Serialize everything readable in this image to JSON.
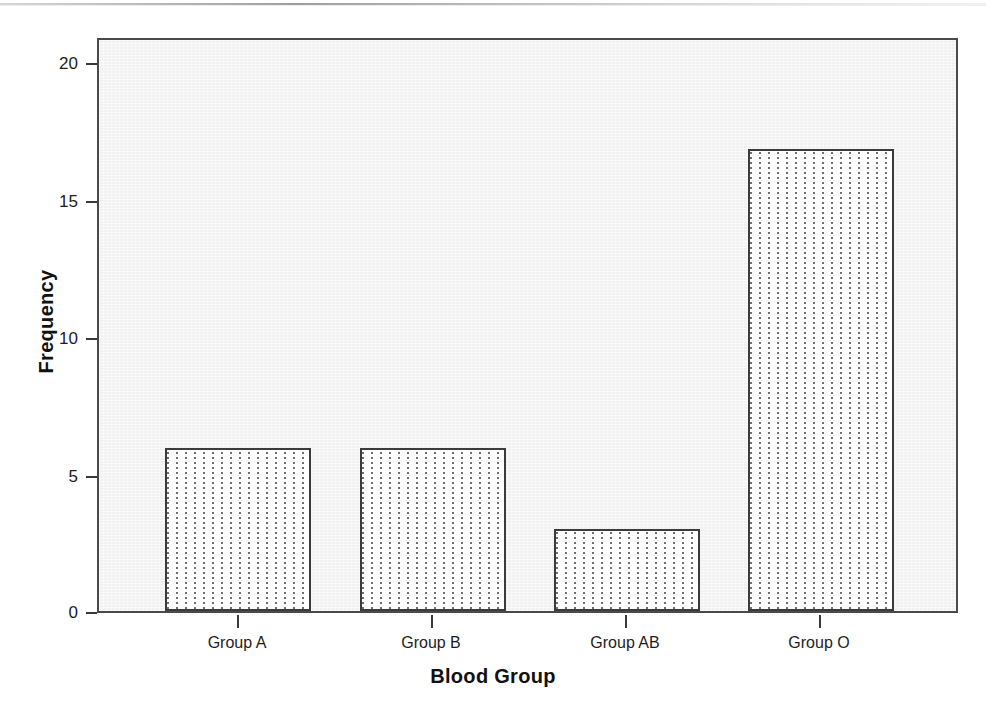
{
  "chart_data": {
    "type": "bar",
    "title": "",
    "xlabel": "Blood Group",
    "ylabel": "Frequency",
    "categories": [
      "Group A",
      "Group B",
      "Group AB",
      "Group O"
    ],
    "values": [
      6,
      6,
      3,
      17
    ],
    "ylim": [
      0,
      21
    ],
    "yticks": [
      0,
      5,
      10,
      15,
      20
    ],
    "ytick_labels": [
      "0",
      "5",
      "10",
      "15",
      "20"
    ],
    "grid": false,
    "legend": null,
    "legend_position": "none",
    "bar_fill": "white-with-vertical-dotted-hatch",
    "bar_edge_color": "#3b3b3b",
    "plot_background": "#f1f1f1",
    "figure_background": "#ffffff"
  },
  "axes": {
    "y": {
      "label": "Frequency",
      "ticks": [
        {
          "value": 20,
          "label": "20"
        },
        {
          "value": 15,
          "label": "15"
        },
        {
          "value": 10,
          "label": "10"
        },
        {
          "value": 5,
          "label": "5"
        },
        {
          "value": 0,
          "label": "0"
        }
      ]
    },
    "x": {
      "label": "Blood Group",
      "ticks": [
        {
          "label": "Group A"
        },
        {
          "label": "Group B"
        },
        {
          "label": "Group AB"
        },
        {
          "label": "Group O"
        }
      ]
    }
  }
}
